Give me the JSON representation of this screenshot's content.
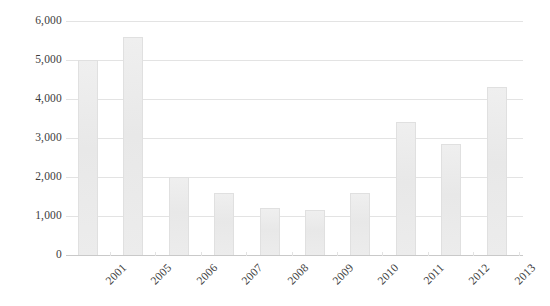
{
  "chart_data": {
    "type": "bar",
    "title": "",
    "subtitle": "",
    "xlabel": "",
    "ylabel": "",
    "categories": [
      "2001",
      "2005",
      "2006",
      "2007",
      "2008",
      "2009",
      "2010",
      "2011",
      "2012",
      "2013"
    ],
    "values": [
      5000,
      5600,
      2000,
      1600,
      1200,
      1150,
      1600,
      3400,
      2850,
      4300
    ],
    "series": [
      {
        "name": "",
        "values": [
          5000,
          5600,
          2000,
          1600,
          1200,
          1150,
          1600,
          3400,
          2850,
          4300
        ]
      }
    ],
    "ylim": [
      0,
      6000
    ],
    "ytick_values": [
      0,
      1000,
      2000,
      3000,
      4000,
      5000,
      6000
    ],
    "ytick_labels": [
      "0",
      "1,000",
      "2,000",
      "3,000",
      "4,000",
      "5,000",
      "6,000"
    ],
    "grid": true,
    "grid_axis": "y",
    "legend": false,
    "legend_position": "none",
    "bar_color": "#ededed",
    "bar_border_color": "#e0e0e0",
    "grid_color": "#e3e3e3",
    "axis_color": "#c9c9c9",
    "text_color": "#3c3c3c",
    "background_color": "#ffffff",
    "xtick_label_rotation": -45
  }
}
